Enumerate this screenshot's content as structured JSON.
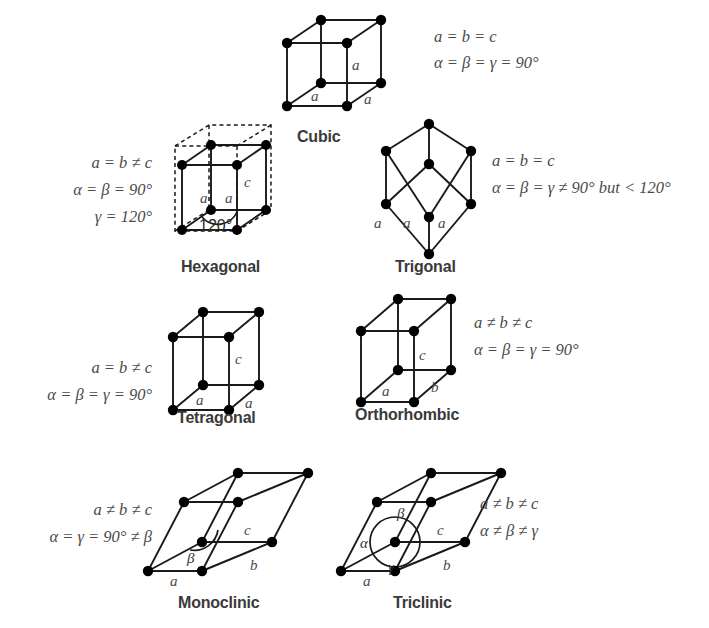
{
  "figure": {
    "background": "#ffffff",
    "line_color": "#1a1a1a",
    "text_color": "#4a4a4a",
    "label_color": "#3a3a3a"
  },
  "systems": [
    {
      "id": "cubic",
      "name": "Cubic",
      "equations": [
        "a = b = c",
        "α = β = γ = 90°"
      ],
      "edge_labels": [
        "a",
        "a",
        "a"
      ],
      "angle_labels": []
    },
    {
      "id": "hexagonal",
      "name": "Hexagonal",
      "equations": [
        "a = b ≠ c",
        "α = β = 90°",
        "γ = 120°"
      ],
      "edge_labels": [
        "c",
        "a",
        "a"
      ],
      "angle_labels": [
        "120°"
      ]
    },
    {
      "id": "trigonal",
      "name": "Trigonal",
      "equations": [
        "a = b = c",
        "α = β = γ ≠ 90° but < 120°"
      ],
      "edge_labels": [
        "a",
        "a",
        "a"
      ],
      "angle_labels": []
    },
    {
      "id": "tetragonal",
      "name": "Tetragonal",
      "equations": [
        "a = b ≠ c",
        "α = β = γ = 90°"
      ],
      "edge_labels": [
        "c",
        "a",
        "a"
      ],
      "angle_labels": []
    },
    {
      "id": "orthorhombic",
      "name": "Orthorhombic",
      "equations": [
        "a ≠ b ≠ c",
        "α = β = γ = 90°"
      ],
      "edge_labels": [
        "c",
        "a",
        "b"
      ],
      "angle_labels": []
    },
    {
      "id": "monoclinic",
      "name": "Monoclinic",
      "equations": [
        "a ≠ b ≠ c",
        "α = γ = 90° ≠ β"
      ],
      "edge_labels": [
        "c",
        "a",
        "b"
      ],
      "angle_labels": [
        "β"
      ]
    },
    {
      "id": "triclinic",
      "name": "Triclinic",
      "equations": [
        "a ≠ b ≠ c",
        "α ≠ β ≠ γ"
      ],
      "edge_labels": [
        "c",
        "a",
        "b"
      ],
      "angle_labels": [
        "α",
        "β",
        "γ"
      ]
    }
  ]
}
